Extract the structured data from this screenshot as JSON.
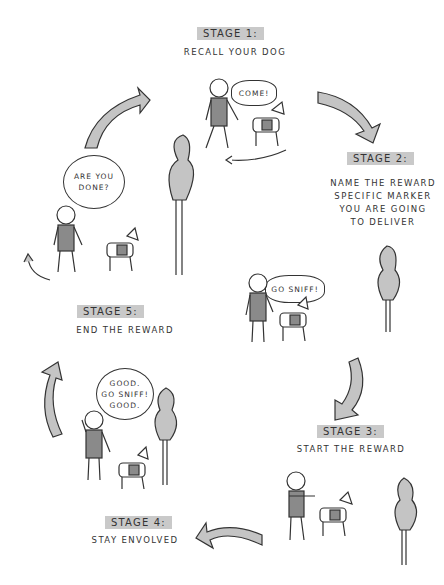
{
  "diagram": {
    "type": "cycle",
    "stages": [
      {
        "label": "STAGE 1:",
        "description": "RECALL YOUR DOG",
        "speech": "COME!"
      },
      {
        "label": "STAGE 2:",
        "description": "NAME THE REWARD SPECIFIC MARKER YOU ARE GOING TO DELIVER",
        "desc_lines": [
          "NAME THE REWARD",
          "SPECIFIC MARKER",
          "YOU ARE GOING",
          "TO DELIVER"
        ],
        "speech": "GO SNIFF!"
      },
      {
        "label": "STAGE 3:",
        "description": "START THE REWARD",
        "speech": ""
      },
      {
        "label": "STAGE 4:",
        "description": "STAY ENVOLVED",
        "speech_lines": [
          "GOOD.",
          "GO SNIFF!",
          "GOOD."
        ]
      },
      {
        "label": "STAGE 5:",
        "description": "END THE REWARD",
        "speech_lines": [
          "ARE YOU",
          "DONE?"
        ]
      }
    ],
    "colors": {
      "fill_gray": "#c4c4c4",
      "line": "#333333",
      "background": "#ffffff"
    }
  }
}
